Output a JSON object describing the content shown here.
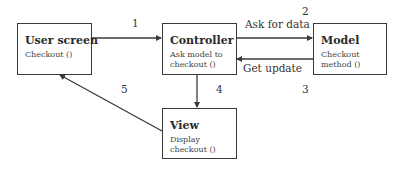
{
  "diagram": {
    "boxes": {
      "user_screen": {
        "title": "User screen",
        "sub": [
          "Checkout ()"
        ]
      },
      "controller": {
        "title": "Controller",
        "sub": [
          "Ask model to",
          "checkout ()"
        ]
      },
      "model": {
        "title": "Model",
        "sub": [
          "Checkout",
          "method ()"
        ]
      },
      "view": {
        "title": "View",
        "sub": [
          "Display",
          "checkout ()"
        ]
      }
    },
    "edges": [
      {
        "from": "User screen",
        "to": "Controller",
        "step": "1",
        "label": ""
      },
      {
        "from": "Controller",
        "to": "Model",
        "step": "2",
        "label": "Ask for data"
      },
      {
        "from": "Model",
        "to": "Controller",
        "step": "3",
        "label": "Get update"
      },
      {
        "from": "Controller",
        "to": "View",
        "step": "4",
        "label": ""
      },
      {
        "from": "View",
        "to": "User screen",
        "step": "5",
        "label": ""
      }
    ],
    "colors": {
      "stroke": "#3a3a3a",
      "background": "#ffffff"
    }
  }
}
